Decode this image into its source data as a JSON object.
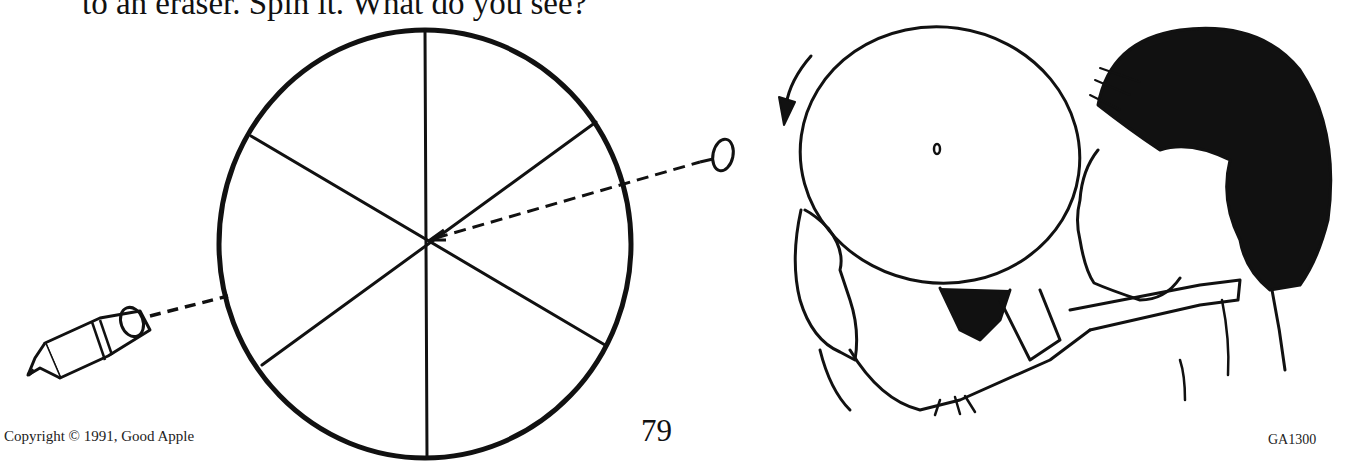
{
  "page": {
    "header_text": "to an eraser. Spin it. What do you see?",
    "page_number": "79",
    "copyright": "Copyright © 1991, Good Apple",
    "code": "GA1300"
  },
  "illustrations": [
    {
      "name": "color-wheel-disk",
      "description": "Circle divided into six sections by three lines through the center"
    },
    {
      "name": "pencil-with-eraser",
      "description": "Pencil pointing at disk center via dashed line"
    },
    {
      "name": "thumbtack",
      "description": "Pin attaching disk to eraser via dashed line"
    },
    {
      "name": "child-spinning-disk",
      "description": "Child holding and blowing on a disk with a rotation arrow"
    }
  ],
  "colors": {
    "ink": "#111111",
    "paper": "#ffffff"
  }
}
